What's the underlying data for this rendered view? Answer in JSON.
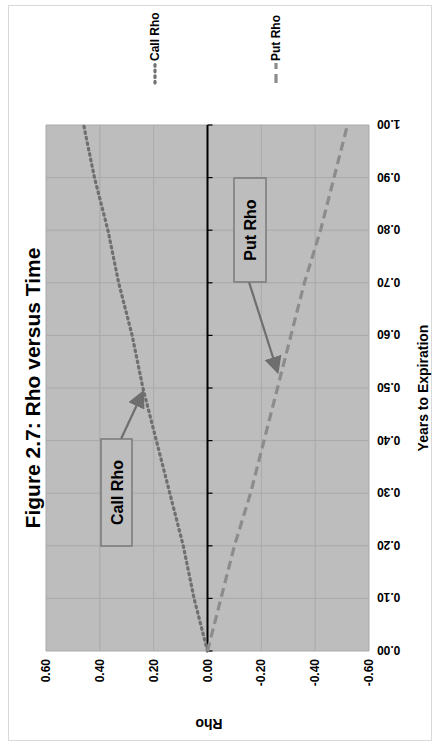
{
  "chart_data": {
    "type": "line",
    "title": "Figure 2.7: Rho versus Time",
    "xlabel": "Years to Expiration",
    "ylabel": "Rho",
    "x": [
      0.0,
      0.1,
      0.2,
      0.3,
      0.4,
      0.5,
      0.6,
      0.7,
      0.8,
      0.9,
      1.0
    ],
    "xticks": [
      "0.00",
      "0.10",
      "0.20",
      "0.30",
      "0.40",
      "0.50",
      "0.60",
      "0.70",
      "0.80",
      "0.90",
      "1.00"
    ],
    "yticks": [
      "0.60",
      "0.40",
      "0.20",
      "0.00",
      "-0.20",
      "-0.40",
      "-0.60"
    ],
    "xlim": [
      0,
      1
    ],
    "ylim": [
      -0.6,
      0.6
    ],
    "grid": true,
    "legend_position": "right",
    "series": [
      {
        "name": "Call Rho",
        "style": "dotted",
        "color": "#707070",
        "values": [
          0.0,
          0.05,
          0.09,
          0.14,
          0.19,
          0.24,
          0.28,
          0.33,
          0.37,
          0.42,
          0.46
        ]
      },
      {
        "name": "Put Rho",
        "style": "dashed",
        "color": "#8c8c8c",
        "values": [
          0.0,
          -0.05,
          -0.1,
          -0.16,
          -0.21,
          -0.26,
          -0.31,
          -0.36,
          -0.42,
          -0.47,
          -0.52
        ]
      }
    ],
    "annotations": [
      {
        "label": "Call Rho",
        "points_to": {
          "x": 0.5,
          "y": 0.24
        }
      },
      {
        "label": "Put Rho",
        "points_to": {
          "x": 0.5,
          "y": -0.26
        }
      }
    ]
  },
  "colors": {
    "plot_background": "#bdbdbd",
    "gridline": "#a9a9a9",
    "zero_line": "#000000",
    "annotation_border": "#7a7a7a"
  }
}
